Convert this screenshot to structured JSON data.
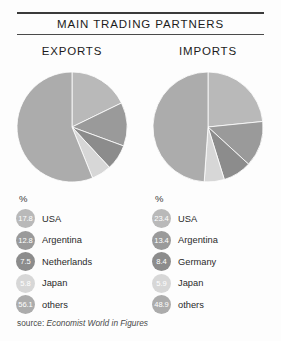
{
  "header": {
    "title": "MAIN TRADING PARTNERS"
  },
  "source": {
    "prefix": "source:",
    "publication": "Economist World in Figures"
  },
  "legend_axis_label": "%",
  "palette": {
    "slice_usa": "#b9b9b9",
    "slice_second": "#9a9a9a",
    "slice_third": "#8c8c8c",
    "slice_japan": "#d7d7d7",
    "slice_others": "#acacac",
    "rule": "#3a3a3a",
    "text": "#1c1c1c"
  },
  "chart_data": [
    {
      "type": "pie",
      "title": "EXPORTS",
      "categories": [
        "USA",
        "Argentina",
        "Netherlands",
        "Japan",
        "others"
      ],
      "values": [
        17.8,
        12.8,
        7.5,
        5.8,
        56.1
      ],
      "unit": "%",
      "start_angle": 0,
      "direction": "clockwise",
      "colors": [
        "#b9b9b9",
        "#9a9a9a",
        "#8c8c8c",
        "#d7d7d7",
        "#acacac"
      ],
      "legend": "right-of-pie-below",
      "labels": [
        {
          "value": "17.8",
          "name": "USA"
        },
        {
          "value": "12.8",
          "name": "Argentina"
        },
        {
          "value": "7.5",
          "name": "Netherlands"
        },
        {
          "value": "5.8",
          "name": "Japan"
        },
        {
          "value": "56.1",
          "name": "others"
        }
      ]
    },
    {
      "type": "pie",
      "title": "IMPORTS",
      "categories": [
        "USA",
        "Argentina",
        "Germany",
        "Japan",
        "others"
      ],
      "values": [
        23.4,
        13.4,
        8.4,
        5.9,
        48.9
      ],
      "unit": "%",
      "start_angle": 0,
      "direction": "clockwise",
      "colors": [
        "#b9b9b9",
        "#9a9a9a",
        "#8c8c8c",
        "#d7d7d7",
        "#acacac"
      ],
      "legend": "right-of-pie-below",
      "labels": [
        {
          "value": "23.4",
          "name": "USA"
        },
        {
          "value": "13.4",
          "name": "Argentina"
        },
        {
          "value": "8.4",
          "name": "Germany"
        },
        {
          "value": "5.9",
          "name": "Japan"
        },
        {
          "value": "48.9",
          "name": "others"
        }
      ]
    }
  ]
}
